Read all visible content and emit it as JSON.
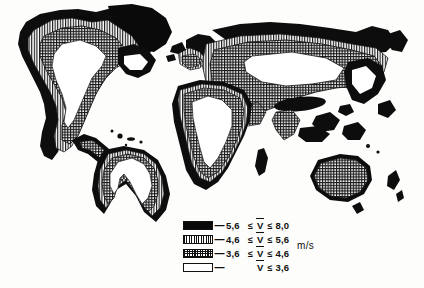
{
  "figure": {
    "background_color": "#fdfdfc",
    "ink_color": "#111111"
  },
  "legend": {
    "unit": "m/s",
    "dash": "—",
    "symbol": "V",
    "rows": [
      {
        "pattern": "solid-black",
        "swatch_name": "swatch-solid-black",
        "low": "5,6",
        "rel_low": "≤",
        "rel_high": "≤",
        "high": "8,0",
        "label": "5,6 ≤ V ≤ 8,0"
      },
      {
        "pattern": "vertical-lines",
        "swatch_name": "swatch-vertical-lines",
        "low": "4,6",
        "rel_low": "≤",
        "rel_high": "≤",
        "high": "5,6",
        "label": "4,6 ≤ V ≤ 5,6"
      },
      {
        "pattern": "cross-hatch",
        "swatch_name": "swatch-cross-hatch",
        "low": "3,6",
        "rel_low": "≤",
        "rel_high": "≤",
        "high": "4,6",
        "label": "3,6 ≤ V ≤ 4,6"
      },
      {
        "pattern": "white-blank",
        "swatch_name": "swatch-white-blank",
        "low": "",
        "rel_low": "",
        "rel_high": "≤",
        "high": "3,6",
        "label": "V ≤ 3,6"
      }
    ]
  },
  "map": {
    "regions": [
      {
        "name": "north-america",
        "classes": [
          "solid-black",
          "vertical-lines",
          "cross-hatch",
          "white-blank"
        ]
      },
      {
        "name": "greenland-arctic-canada",
        "classes": [
          "solid-black"
        ]
      },
      {
        "name": "central-america-caribbean",
        "classes": [
          "solid-black",
          "cross-hatch"
        ]
      },
      {
        "name": "south-america",
        "classes": [
          "solid-black",
          "vertical-lines",
          "cross-hatch",
          "white-blank"
        ]
      },
      {
        "name": "europe",
        "classes": [
          "solid-black",
          "vertical-lines",
          "cross-hatch"
        ]
      },
      {
        "name": "africa",
        "classes": [
          "solid-black",
          "vertical-lines",
          "cross-hatch",
          "white-blank"
        ]
      },
      {
        "name": "madagascar",
        "classes": [
          "solid-black"
        ]
      },
      {
        "name": "asia",
        "classes": [
          "solid-black",
          "vertical-lines",
          "cross-hatch",
          "white-blank"
        ]
      },
      {
        "name": "southeast-asia-islands",
        "classes": [
          "solid-black",
          "cross-hatch"
        ]
      },
      {
        "name": "australia",
        "classes": [
          "solid-black",
          "cross-hatch"
        ]
      },
      {
        "name": "new-zealand",
        "classes": [
          "solid-black"
        ]
      }
    ]
  }
}
